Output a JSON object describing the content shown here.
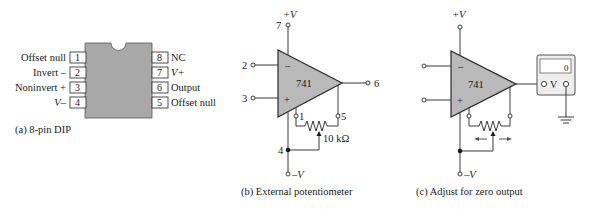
{
  "figure": {
    "colors": {
      "chip_fill": "#a8a8a8",
      "opamp_fill": "#b9b9b9",
      "line": "#3a3a3a",
      "background": "#ffffff"
    },
    "panel_a": {
      "caption": "(a) 8-pin DIP",
      "left_pins": [
        {
          "num": "1",
          "label": "Offset null"
        },
        {
          "num": "2",
          "label": "Invert –"
        },
        {
          "num": "3",
          "label": "Noninvert +"
        },
        {
          "num": "4",
          "label": "V–"
        }
      ],
      "right_pins": [
        {
          "num": "8",
          "label": "NC"
        },
        {
          "num": "7",
          "label": "V+"
        },
        {
          "num": "6",
          "label": "Output"
        },
        {
          "num": "5",
          "label": "Offset null"
        }
      ]
    },
    "panel_b": {
      "caption": "(b) External potentiometer",
      "opamp_label": "741",
      "supply_pos": "+V",
      "supply_neg": "–V",
      "inverting_sign": "–",
      "noninverting_sign": "+",
      "pin_labels": {
        "p7": "7",
        "p2": "2",
        "p3": "3",
        "p6": "6",
        "p1": "1",
        "p5": "5",
        "p4": "4"
      },
      "pot_value": "10 kΩ"
    },
    "panel_c": {
      "caption": "(c) Adjust for zero output",
      "opamp_label": "741",
      "supply_pos": "+V",
      "supply_neg": "–V",
      "inverting_sign": "–",
      "noninverting_sign": "+",
      "meter_label": "V",
      "meter_reading": "0"
    }
  }
}
